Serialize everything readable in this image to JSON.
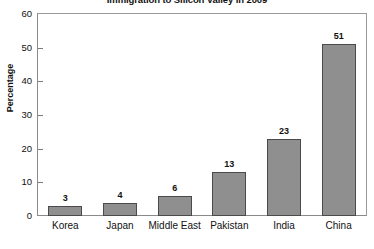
{
  "chart_data": {
    "type": "bar",
    "title": "Immigration to Silicon Valley in 2009",
    "xlabel": "",
    "ylabel": "Percentage",
    "ylim": [
      0,
      60
    ],
    "yticks": [
      0,
      10,
      20,
      30,
      40,
      50,
      60
    ],
    "grid": false,
    "legend": false,
    "categories": [
      "Korea",
      "Japan",
      "Middle East",
      "Pakistan",
      "India",
      "China"
    ],
    "values": [
      3,
      4,
      6,
      13,
      23,
      51
    ],
    "data_labels": [
      "3",
      "4",
      "6",
      "13",
      "23",
      "51"
    ],
    "bar_color": "#8f8f8f",
    "bar_border_color": "#4a4a4a",
    "axis_color": "#8a8a8a",
    "text_color": "#111111",
    "background_color": "#ffffff"
  }
}
